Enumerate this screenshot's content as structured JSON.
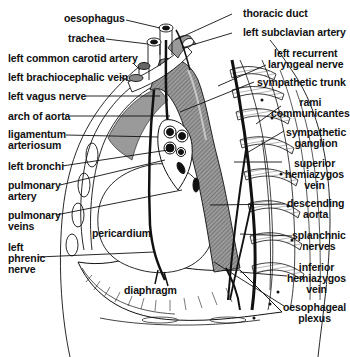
{
  "diagram": {
    "labels_left": [
      {
        "id": "oesophagus",
        "text": "oesophagus"
      },
      {
        "id": "trachea",
        "text": "trachea"
      },
      {
        "id": "left-common-carotid-artery",
        "text": "left common carotid artery"
      },
      {
        "id": "left-brachiocephalic-vein",
        "text": "left brachiocephalic vein"
      },
      {
        "id": "left-vagus-nerve",
        "text": "left vagus nerve"
      },
      {
        "id": "arch-of-aorta",
        "text": "arch of aorta"
      },
      {
        "id": "ligamentum-arteriosum",
        "line1": "ligamentum",
        "line2": "arteriosum"
      },
      {
        "id": "left-bronchi",
        "text": "left bronchi"
      },
      {
        "id": "pulmonary-artery",
        "line1": "pulmonary",
        "line2": "artery"
      },
      {
        "id": "pulmonary-veins",
        "line1": "pulmonary",
        "line2": "veins"
      },
      {
        "id": "left-phrenic-nerve",
        "line1": "left",
        "line2": "phrenic",
        "line3": "nerve"
      }
    ],
    "labels_right": [
      {
        "id": "thoracic-duct",
        "text": "thoracic duct"
      },
      {
        "id": "left-subclavian-artery",
        "text": "left subclavian artery"
      },
      {
        "id": "left-recurrent-laryngeal-nerve",
        "line1": "left recurrent",
        "line2": "laryngeal nerve"
      },
      {
        "id": "sympathetic-trunk",
        "text": "sympathetic trunk"
      },
      {
        "id": "rami-communicantes",
        "line1": "rami",
        "line2": "communicantes"
      },
      {
        "id": "sympathetic-ganglion",
        "line1": "sympathetic",
        "line2": "ganglion"
      },
      {
        "id": "superior-hemiazygos-vein",
        "line1": "superior",
        "line2": "hemiazygos",
        "line3": "vein"
      },
      {
        "id": "descending-aorta",
        "line1": "descending",
        "line2": "aorta"
      },
      {
        "id": "splanchnic-nerves",
        "line1": "splanchnic",
        "line2": "nerves"
      },
      {
        "id": "inferior-hemiazygos-vein",
        "line1": "inferior",
        "line2": "hemiazygos",
        "line3": "vein"
      },
      {
        "id": "oesophageal-plexus",
        "line1": "oesophageal",
        "line2": "plexus"
      }
    ],
    "labels_inner": [
      {
        "id": "pericardium",
        "text": "pericardium"
      },
      {
        "id": "diaphragm",
        "text": "diaphragm"
      }
    ],
    "colors": {
      "ink": "#111111",
      "aorta_fill": "#8a8a8a",
      "shade_fill": "#b5b5b5",
      "background": "#ffffff"
    }
  }
}
